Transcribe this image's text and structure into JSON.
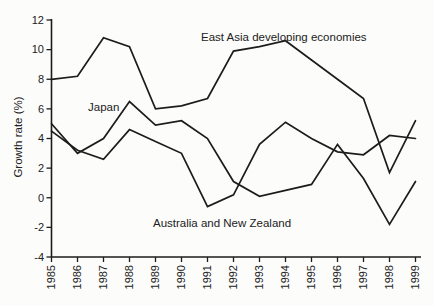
{
  "figure": {
    "background": "#fcfcfb",
    "ink_color": "#1c1c1c"
  },
  "chart_data": {
    "type": "line",
    "title": "",
    "xlabel": "",
    "ylabel": "Growth rate (%)",
    "x": [
      1985,
      1986,
      1987,
      1988,
      1989,
      1990,
      1991,
      1992,
      1993,
      1994,
      1995,
      1996,
      1997,
      1998,
      1999
    ],
    "x_tick_labels": [
      "1985",
      "1986",
      "1987",
      "1988",
      "1989",
      "1990",
      "1991",
      "1992",
      "1993",
      "1994",
      "1995",
      "1996",
      "1997",
      "1998",
      "1999"
    ],
    "y_ticks": [
      12,
      10,
      8,
      6,
      4,
      2,
      0,
      -2,
      -4
    ],
    "y_tick_labels": [
      "12",
      "10",
      "8",
      "6",
      "4",
      "2",
      "0",
      "-2",
      "-4"
    ],
    "ylim": [
      -4,
      12
    ],
    "xlim": [
      1985,
      1999
    ],
    "grid": false,
    "legend_position": "inline-annotations",
    "line_color": "#1c1c1c",
    "series": [
      {
        "name": "East Asia developing economies",
        "values": [
          8.0,
          8.2,
          10.8,
          10.2,
          6.0,
          6.2,
          6.7,
          9.9,
          10.2,
          10.6,
          9.3,
          8.0,
          6.7,
          1.7,
          5.2
        ]
      },
      {
        "name": "Japan",
        "values": [
          5.0,
          3.0,
          4.0,
          6.5,
          4.9,
          5.2,
          4.0,
          1.1,
          0.1,
          0.5,
          0.9,
          3.6,
          1.3,
          -1.8,
          1.1
        ]
      },
      {
        "name": "Australia and New Zealand",
        "values": [
          4.5,
          3.2,
          2.6,
          4.6,
          3.8,
          3.0,
          -0.6,
          0.2,
          3.6,
          5.1,
          4.0,
          3.1,
          2.9,
          4.2,
          4.0
        ]
      }
    ],
    "annotations": [
      {
        "text": "East Asia developing economies",
        "x_px": 201,
        "y_px": 41
      },
      {
        "text": "Japan",
        "x_px": 88,
        "y_px": 111
      },
      {
        "text": "Australia and New Zealand",
        "x_px": 153,
        "y_px": 227
      }
    ]
  }
}
